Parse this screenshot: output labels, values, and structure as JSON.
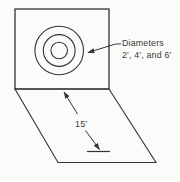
{
  "figure": {
    "colors": {
      "background": "#fbfbf9",
      "line": "#343434",
      "text": "#3a3a3a"
    },
    "annotations": {
      "diameters_label_line1": "Diameters",
      "diameters_label_line2": "2′, 4′, and 6′",
      "distance_label": "15′"
    },
    "diagram_data": {
      "wall_circles": {
        "count": 3,
        "concentric": true,
        "diameters_ft": [
          2,
          4,
          6
        ]
      },
      "floor_distance_ft": 15,
      "shapes": [
        "square wall panel",
        "three concentric circles",
        "parallelogram floor plane",
        "leader arrow to circles",
        "two-segment dimension arrow on floor",
        "short floor mark line"
      ]
    }
  }
}
